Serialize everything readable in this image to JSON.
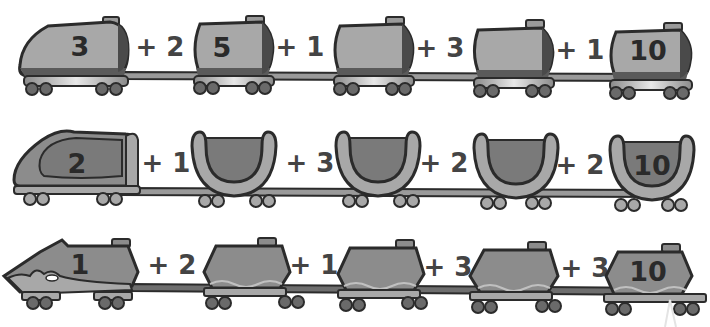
{
  "worksheet": {
    "rows": [
      {
        "style": "tanker-train",
        "cars": [
          {
            "value": "3",
            "role": "start"
          },
          {
            "value": "5"
          },
          {
            "value": ""
          },
          {
            "value": ""
          },
          {
            "value": "10",
            "role": "end"
          }
        ],
        "steps": [
          "+ 2",
          "+ 1",
          "+ 3",
          "+ 1"
        ]
      },
      {
        "style": "hopper-train",
        "cars": [
          {
            "value": "2",
            "role": "start"
          },
          {
            "value": ""
          },
          {
            "value": ""
          },
          {
            "value": ""
          },
          {
            "value": "10",
            "role": "end"
          }
        ],
        "steps": [
          "+ 1",
          "+ 3",
          "+ 2",
          "+ 2"
        ]
      },
      {
        "style": "flame-train",
        "cars": [
          {
            "value": "1",
            "role": "start"
          },
          {
            "value": ""
          },
          {
            "value": ""
          },
          {
            "value": ""
          },
          {
            "value": "10",
            "role": "end"
          }
        ],
        "steps": [
          "+ 2",
          "+ 1",
          "+ 3",
          "+ 3"
        ]
      }
    ]
  },
  "colors": {
    "body_light": "#a8a8a8",
    "body_mid": "#8c8c8c",
    "body_dark": "#6e6e6e",
    "outline": "#2b2b2b",
    "wheel": "#6a6a6a",
    "text": "#2a2a2a"
  }
}
